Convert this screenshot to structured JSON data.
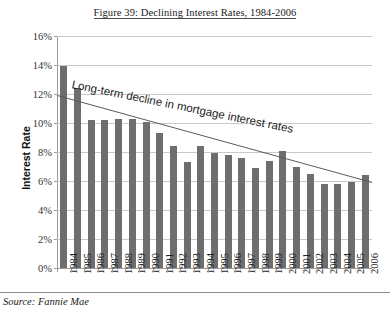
{
  "chart_data": {
    "type": "bar",
    "title": "Figure 39: Declining Interest Rates, 1984-2006",
    "xlabel": "",
    "ylabel": "Interest Rate",
    "ylim": [
      0,
      16
    ],
    "ytick_step": 2,
    "ytick_labels": [
      "16%",
      "14%",
      "12%",
      "10%",
      "8%",
      "6%",
      "4%",
      "2%",
      "0%"
    ],
    "ytick_values": [
      16,
      14,
      12,
      10,
      8,
      6,
      4,
      2,
      0
    ],
    "grid": true,
    "legend": "none",
    "categories": [
      "1984",
      "1985",
      "1986",
      "1987",
      "1988",
      "1989",
      "1990",
      "1991",
      "1992",
      "1993",
      "1994",
      "1995",
      "1996",
      "1997",
      "1998",
      "1999",
      "2000",
      "2001",
      "2002",
      "2003",
      "2004",
      "2005",
      "2006"
    ],
    "values": [
      13.9,
      12.4,
      10.2,
      10.2,
      10.3,
      10.3,
      10.1,
      9.3,
      8.4,
      7.3,
      8.4,
      7.9,
      7.8,
      7.6,
      6.9,
      7.4,
      8.1,
      7.0,
      6.5,
      5.8,
      5.8,
      5.9,
      6.4
    ],
    "bar_color": "#6e6e6e",
    "trendline": {
      "label": "Long-term decline in mortgage interest rates",
      "start_value": 11.9,
      "end_value": 5.9,
      "color": "#5a5a5a"
    },
    "annotations": [
      "Long-term decline in mortgage interest rates"
    ]
  },
  "figure": {
    "title": "Figure 39: Declining Interest Rates, 1984-2006",
    "source_note": "Source: Fannie Mae"
  }
}
